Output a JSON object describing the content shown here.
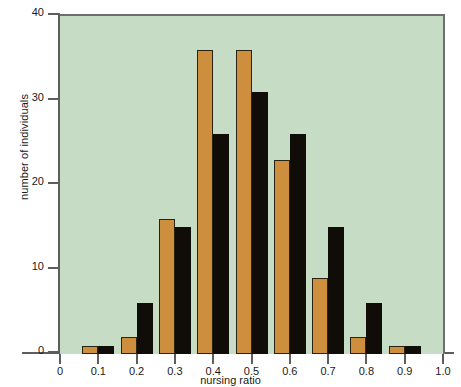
{
  "chart_data": {
    "type": "bar",
    "title": "",
    "xlabel": "nursing ratio",
    "ylabel": "number of individuals",
    "categories": [
      "0.1",
      "0.2",
      "0.3",
      "0.4",
      "0.5",
      "0.6",
      "0.7",
      "0.8",
      "0.9"
    ],
    "series": [
      {
        "name": "orange",
        "color": "#cd8e3e",
        "values": [
          1,
          2,
          16,
          36,
          36,
          23,
          9,
          2,
          1
        ]
      },
      {
        "name": "black",
        "color": "#100d08",
        "values": [
          1,
          6,
          15,
          26,
          31,
          26,
          15,
          6,
          1
        ]
      }
    ],
    "xlim": [
      0,
      1.0
    ],
    "ylim": [
      0,
      40
    ],
    "xticks": [
      "0",
      "0.1",
      "0.2",
      "0.3",
      "0.4",
      "0.5",
      "0.6",
      "0.7",
      "0.8",
      "0.9",
      "1.0"
    ],
    "yticks": [
      "0",
      "10",
      "20",
      "30",
      "40"
    ],
    "grid": false,
    "legend": "none",
    "plot_background_color": "#c6dcc4",
    "axis_color": "#5d5d5d"
  },
  "axes": {
    "y_title": "number of individuals",
    "x_title": "nursing ratio"
  }
}
